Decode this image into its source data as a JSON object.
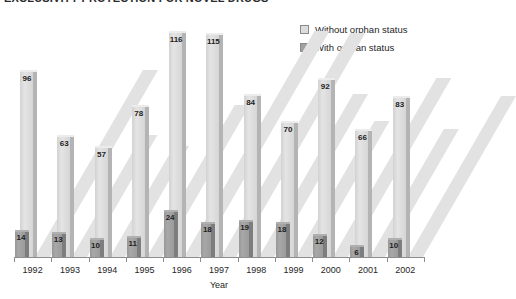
{
  "title": "EXCLUSIVITY PROTECTION FOR NOVEL DRUGS",
  "legend": {
    "position": "top-right",
    "items": [
      {
        "label": "Without orphan status",
        "color": "#dcdcdc",
        "name": "without-orphan-status"
      },
      {
        "label": "With orphan status",
        "color": "#a0a0a0",
        "name": "with-orphan-status"
      }
    ]
  },
  "axis": {
    "xlabel": "Year",
    "ticks": [
      "1992",
      "1993",
      "1994",
      "1995",
      "1996",
      "1997",
      "1998",
      "1999",
      "2000",
      "2001",
      "2002"
    ]
  },
  "chart_data": {
    "type": "bar",
    "title": "EXCLUSIVITY PROTECTION FOR NOVEL DRUGS",
    "xlabel": "Year",
    "ylabel": "",
    "ylim": [
      0,
      125
    ],
    "grid": false,
    "legend_position": "top-right",
    "categories": [
      "1992",
      "1993",
      "1994",
      "1995",
      "1996",
      "1997",
      "1998",
      "1999",
      "2000",
      "2001",
      "2002"
    ],
    "series": [
      {
        "name": "Without orphan status",
        "color": "#dcdcdc",
        "values": [
          96,
          63,
          57,
          78,
          116,
          115,
          84,
          70,
          92,
          66,
          83
        ]
      },
      {
        "name": "With orphan status",
        "color": "#a0a0a0",
        "values": [
          14,
          13,
          10,
          11,
          24,
          18,
          19,
          18,
          12,
          6,
          10
        ]
      }
    ]
  }
}
